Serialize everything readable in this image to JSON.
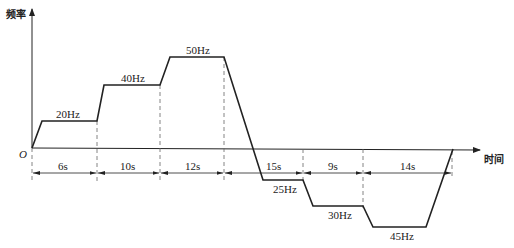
{
  "diagram": {
    "y_axis_label": "频率",
    "x_axis_label": "时间",
    "origin_label": "O",
    "segments": [
      {
        "duration": "6s",
        "frequency": "20Hz",
        "direction": "forward"
      },
      {
        "duration": "10s",
        "frequency": "40Hz",
        "direction": "forward"
      },
      {
        "duration": "12s",
        "frequency": "50Hz",
        "direction": "forward"
      },
      {
        "duration": "15s",
        "frequency": "25Hz",
        "direction": "reverse"
      },
      {
        "duration": "9s",
        "frequency": "30Hz",
        "direction": "reverse"
      },
      {
        "duration": "14s",
        "frequency": "45Hz",
        "direction": "reverse"
      }
    ],
    "colors": {
      "line": "#222222",
      "dashed": "#666666",
      "background": "#ffffff"
    }
  }
}
